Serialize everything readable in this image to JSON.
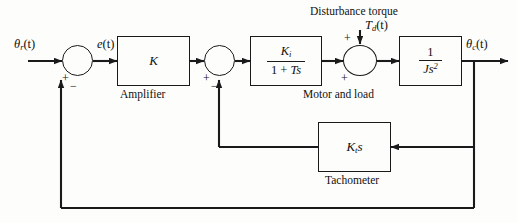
{
  "diagram": {
    "line_color": "#1a1a1a",
    "background": "#fdfdfb"
  },
  "signals": {
    "reference_input": "θ",
    "reference_input_sub": "r",
    "reference_input_arg": "(t)",
    "error": "e",
    "error_arg": "(t)",
    "disturbance": "T",
    "disturbance_sub": "d",
    "disturbance_arg": "(t)",
    "output": "θ",
    "output_sub": "c",
    "output_arg": "(t)"
  },
  "labels": {
    "disturbance_torque": "Disturbance torque",
    "amplifier": "Amplifier",
    "motor_and_load": "Motor and load",
    "tachometer": "Tachometer"
  },
  "blocks": {
    "amplifier": {
      "name": "amplifier-block",
      "gain": "K",
      "caption": "Amplifier"
    },
    "motor": {
      "name": "motor-block",
      "numerator": "K",
      "numerator_sub": "i",
      "denominator_a": "1 + ",
      "denominator_b": "Ts",
      "caption": "Motor and load"
    },
    "load": {
      "name": "load-block",
      "numerator": "1",
      "denominator": "Js",
      "denominator_exp": "2"
    },
    "tachometer": {
      "name": "tachometer-block",
      "gain": "K",
      "gain_sub": "t",
      "gain_tail": "s",
      "caption": "Tachometer"
    }
  },
  "junctions": [
    {
      "id": "sum-1",
      "signs": {
        "left": "+",
        "bottom": "−"
      }
    },
    {
      "id": "sum-2",
      "signs": {
        "left": "+",
        "bottom": "−"
      }
    },
    {
      "id": "sum-3",
      "signs": {
        "left": "+",
        "top": "+"
      }
    }
  ]
}
